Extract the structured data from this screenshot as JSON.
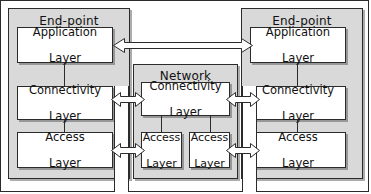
{
  "diagram": {
    "colors": {
      "group_fill": "#d9d9d9",
      "layer_fill": "#ffffff",
      "stroke": "#2b2b2b",
      "arrow_fill": "#ffffff",
      "page_background": "#ffffff"
    },
    "groups": [
      {
        "id": "endpoint-left",
        "label": "End-point"
      },
      {
        "id": "network",
        "label": "Network"
      },
      {
        "id": "endpoint-right",
        "label": "End-point"
      }
    ],
    "endpoint_left": {
      "label": "End-point",
      "layers": [
        {
          "id": "application",
          "line1": "Application",
          "line2": "Layer"
        },
        {
          "id": "connectivity",
          "line1": "Connectivity",
          "line2": "Layer"
        },
        {
          "id": "access",
          "line1": "Access",
          "line2": "Layer"
        }
      ]
    },
    "network": {
      "label": "Network",
      "layers": [
        {
          "id": "connectivity",
          "line1": "Connectivity",
          "line2": "Layer"
        },
        {
          "id": "access-left",
          "line1": "Access",
          "line2": "Layer"
        },
        {
          "id": "access-right",
          "line1": "Access",
          "line2": "Layer"
        }
      ]
    },
    "endpoint_right": {
      "label": "End-point",
      "layers": [
        {
          "id": "application",
          "line1": "Application",
          "line2": "Layer"
        },
        {
          "id": "connectivity",
          "line1": "Connectivity",
          "line2": "Layer"
        },
        {
          "id": "access",
          "line1": "Access",
          "line2": "Layer"
        }
      ]
    },
    "connectors": [
      {
        "id": "application-peer-link",
        "kind": "double-headed-arrow",
        "orientation": "horizontal",
        "from": "endpoint-left.application",
        "to": "endpoint-right.application"
      },
      {
        "id": "connectivity-link-left",
        "kind": "double-headed-arrow",
        "orientation": "horizontal",
        "from": "endpoint-left.connectivity",
        "to": "network.connectivity"
      },
      {
        "id": "access-link-left",
        "kind": "double-headed-arrow",
        "orientation": "horizontal",
        "from": "endpoint-left.access",
        "to": "network.access-left"
      },
      {
        "id": "connectivity-link-right",
        "kind": "double-headed-arrow",
        "orientation": "horizontal",
        "from": "network.connectivity",
        "to": "endpoint-right.connectivity"
      },
      {
        "id": "access-link-right",
        "kind": "double-headed-arrow",
        "orientation": "horizontal",
        "from": "network.access-right",
        "to": "endpoint-right.access"
      }
    ]
  }
}
